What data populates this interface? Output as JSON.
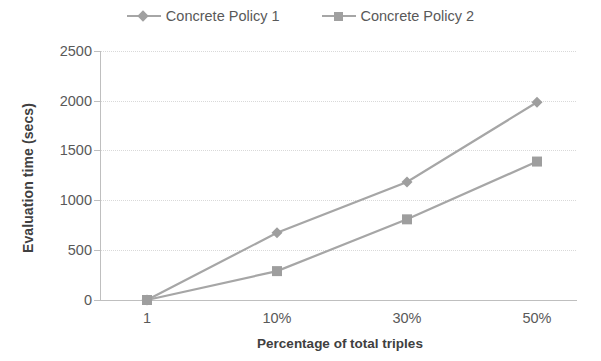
{
  "chart_data": {
    "type": "line",
    "title": "",
    "xlabel": "Percentage of total triples",
    "ylabel": "Evaluation time (secs)",
    "categories": [
      "1",
      "10%",
      "30%",
      "50%"
    ],
    "series": [
      {
        "name": "Concrete Policy 1",
        "marker": "diamond",
        "color": "#a6a6a6",
        "values": [
          0,
          675,
          1185,
          1985
        ]
      },
      {
        "name": "Concrete Policy 2",
        "marker": "square",
        "color": "#a6a6a6",
        "values": [
          0,
          290,
          810,
          1390
        ]
      }
    ],
    "ylim": [
      0,
      2500
    ],
    "y_ticks": [
      0,
      500,
      1000,
      1500,
      2000,
      2500
    ],
    "y_tick_labels": [
      "0",
      "500",
      "1000",
      "1500",
      "2000",
      "2500"
    ],
    "grid": true,
    "legend_position": "top",
    "colors": {
      "line": "#a6a6a6",
      "marker": "#9e9e9e",
      "gridline": "#d9d9d9",
      "axis": "#bfbfbf",
      "tick_text": "#595959",
      "axis_title_text": "#404040",
      "background": "#ffffff"
    }
  },
  "legend": {
    "entries": [
      {
        "label": "Concrete Policy 1",
        "marker": "diamond-marker-icon"
      },
      {
        "label": "Concrete Policy 2",
        "marker": "square-marker-icon"
      }
    ]
  },
  "axes": {
    "y_title": "Evaluation time (secs)",
    "x_title": "Percentage of total triples",
    "y_labels": [
      "2500",
      "2000",
      "1500",
      "1000",
      "500",
      "0"
    ],
    "x_labels": [
      "1",
      "10%",
      "30%",
      "50%"
    ]
  }
}
